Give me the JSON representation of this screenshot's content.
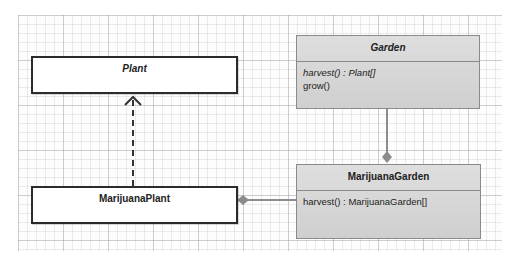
{
  "diagram": {
    "type": "UML class diagram",
    "classes": [
      {
        "id": "plant",
        "name": "Plant",
        "abstract": true,
        "operations": []
      },
      {
        "id": "garden",
        "name": "Garden",
        "abstract": true,
        "operations": [
          {
            "text": "harvest() : Plant[]",
            "abstract": true
          },
          {
            "text": "grow()",
            "abstract": false
          }
        ]
      },
      {
        "id": "marijuana_plant",
        "name": "MarijuanaPlant",
        "abstract": false,
        "operations": []
      },
      {
        "id": "marijuana_garden",
        "name": "MarijuanaGarden",
        "abstract": false,
        "operations": [
          {
            "text": "harvest() : MarijuanaGarden[]",
            "abstract": false
          }
        ]
      }
    ],
    "relationships": [
      {
        "type": "realization",
        "from": "MarijuanaPlant",
        "to": "Plant",
        "style": "dashed, open arrowhead"
      },
      {
        "type": "aggregation",
        "from": "MarijuanaGarden",
        "to": "Garden",
        "style": "solid, diamond"
      },
      {
        "type": "aggregation",
        "from": "MarijuanaGarden",
        "to": "MarijuanaPlant",
        "style": "solid, diamond"
      }
    ]
  },
  "colors": {
    "interface_fill": "#ffffff",
    "interface_border": "#2b2b2b",
    "class_fill": "#d6d6d6",
    "class_border": "#8a8a8a",
    "connector": "#8c8c8c",
    "dashed_arrow": "#333333"
  }
}
